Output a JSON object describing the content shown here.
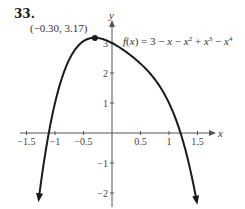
{
  "problem_number": "33.",
  "chart_data": {
    "type": "line",
    "title": "",
    "function_label": "f(x) = 3 − x − x² + x³ − x⁴",
    "function_label_parts": [
      "f",
      "(",
      "x",
      ") = 3 − ",
      "x",
      " − ",
      "x",
      "2",
      " + ",
      "x",
      "3",
      " − ",
      "x",
      "4"
    ],
    "xlabel": "x",
    "ylabel": "y",
    "xlim": [
      -1.5,
      1.5
    ],
    "ylim": [
      -2.2,
      3.5
    ],
    "x_ticks": [
      -1.5,
      -1,
      -0.5,
      0.5,
      1,
      1.5
    ],
    "x_tick_labels": [
      "−1.5",
      "−1",
      "−0.5",
      "0.5",
      "1",
      "1.5"
    ],
    "y_ticks": [
      -2,
      -1,
      1,
      2,
      3
    ],
    "y_tick_labels": [
      "−2",
      "−1",
      "1",
      "2",
      "3"
    ],
    "grid": false,
    "curve_domain": [
      -1.28,
      1.48
    ],
    "coefficients": {
      "c0": 3,
      "c1": -1,
      "c2": -1,
      "c3": 1,
      "c4": -1
    },
    "annotations": [
      {
        "label": "(−0.30, 3.17)",
        "x": -0.3,
        "y": 3.17,
        "type": "local maximum"
      }
    ],
    "series": [
      {
        "name": "f(x)",
        "x": [
          -1.28,
          -1.2,
          -1.1,
          -1.0,
          -0.9,
          -0.8,
          -0.7,
          -0.6,
          -0.5,
          -0.4,
          -0.3,
          -0.2,
          -0.1,
          0.0,
          0.1,
          0.2,
          0.3,
          0.4,
          0.5,
          0.6,
          0.7,
          0.8,
          0.9,
          1.0,
          1.1,
          1.2,
          1.3,
          1.4,
          1.48
        ],
        "values": [
          -2.14,
          -1.04,
          -0.06,
          1.0,
          1.77,
          2.37,
          2.79,
          3.05,
          3.19,
          3.25,
          3.17,
          3.15,
          3.09,
          3.0,
          2.89,
          2.77,
          2.63,
          2.46,
          2.25,
          2.0,
          1.67,
          1.25,
          0.71,
          0.0,
          -0.91,
          -2.07,
          -0.65,
          -1.46,
          -2.23
        ]
      }
    ]
  },
  "colors": {
    "curve": "#1a1a1a",
    "axis": "#555555",
    "text": "#333333"
  }
}
